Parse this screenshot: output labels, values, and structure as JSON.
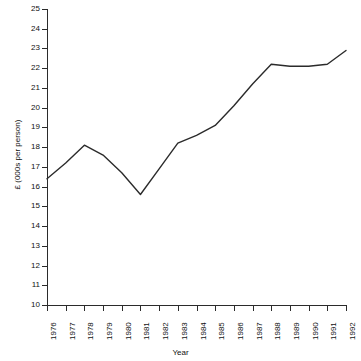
{
  "chart_data": {
    "type": "line",
    "title": "",
    "xlabel": "Year",
    "ylabel": "£ (000s per person)",
    "x": [
      1976,
      1977,
      1978,
      1979,
      1980,
      1981,
      1982,
      1983,
      1984,
      1985,
      1986,
      1987,
      1988,
      1989,
      1990,
      1991,
      1992
    ],
    "categories": [
      "1976",
      "1977",
      "1978",
      "1979",
      "1980",
      "1981",
      "1982",
      "1983",
      "1984",
      "1985",
      "1986",
      "1987",
      "1988",
      "1989",
      "1990",
      "1991",
      "1992"
    ],
    "values": [
      16.4,
      17.2,
      18.1,
      17.6,
      16.7,
      15.6,
      16.9,
      18.2,
      18.6,
      19.1,
      20.1,
      21.2,
      22.2,
      22.1,
      22.1,
      22.2,
      22.9
    ],
    "series": [
      {
        "name": "",
        "values": [
          16.4,
          17.2,
          18.1,
          17.6,
          16.7,
          15.6,
          16.9,
          18.2,
          18.6,
          19.1,
          20.1,
          21.2,
          22.2,
          22.1,
          22.1,
          22.2,
          22.9
        ]
      }
    ],
    "ylim": [
      10,
      25
    ],
    "xlim": [
      1976,
      1992
    ],
    "ytick_labels": [
      "10",
      "11",
      "12",
      "13",
      "14",
      "15",
      "16",
      "17",
      "18",
      "19",
      "20",
      "21",
      "22",
      "23",
      "24",
      "25"
    ],
    "yticks": [
      10,
      11,
      12,
      13,
      14,
      15,
      16,
      17,
      18,
      19,
      20,
      21,
      22,
      23,
      24,
      25
    ],
    "xtick_labels": [
      "1976",
      "1977",
      "1978",
      "1979",
      "1980",
      "1981",
      "1982",
      "1983",
      "1984",
      "1985",
      "1986",
      "1987",
      "1988",
      "1989",
      "1990",
      "1991",
      "1992"
    ],
    "grid": false,
    "legend": false,
    "legend_position": "none",
    "line_color": "#2b2b2b",
    "background_color": "#ffffff"
  }
}
